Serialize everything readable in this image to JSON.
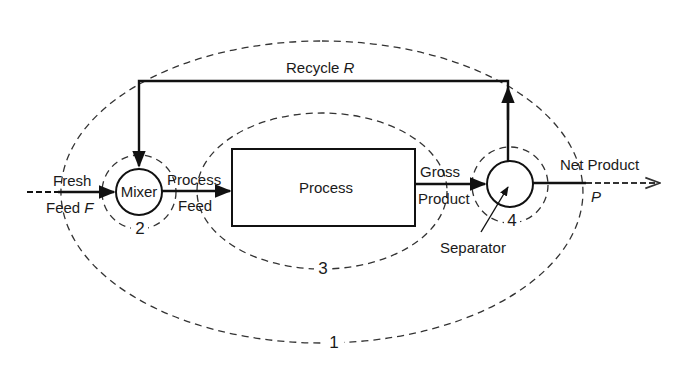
{
  "diagram": {
    "type": "process flow diagram with recycle",
    "streams": {
      "fresh_feed": {
        "line1": "Fresh",
        "line2_prefix": "Feed ",
        "symbol": "F"
      },
      "process_feed": {
        "line1": "Process",
        "line2": "Feed"
      },
      "gross_product": {
        "line1": "Gross",
        "line2": "Product"
      },
      "net_product": {
        "label": "Net Product",
        "symbol": "P"
      },
      "recycle": {
        "label_prefix": "Recycle ",
        "symbol": "R"
      }
    },
    "units": {
      "mixer": {
        "label": "Mixer"
      },
      "process": {
        "label": "Process"
      },
      "separator": {
        "label": "Separator"
      }
    },
    "system_boundaries": [
      {
        "id": "1",
        "label": "1",
        "encloses": "entire process"
      },
      {
        "id": "2",
        "label": "2",
        "encloses": "mixer"
      },
      {
        "id": "3",
        "label": "3",
        "encloses": "process"
      },
      {
        "id": "4",
        "label": "4",
        "encloses": "separator"
      }
    ],
    "colors": {
      "line": "#111111",
      "boundary": "#333333",
      "background": "#ffffff"
    }
  }
}
